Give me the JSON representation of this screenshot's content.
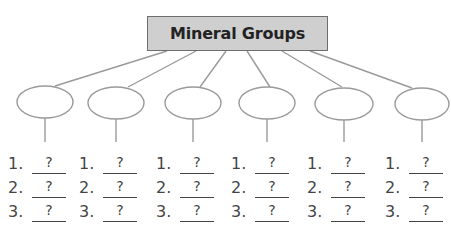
{
  "title": "Mineral Groups",
  "colors": {
    "box_fill": "#cfcfcf",
    "box_border": "#6e6e6e",
    "line": "#9a9a9a",
    "text": "#444444"
  },
  "groups": [
    {
      "cx": 45,
      "items": [
        {
          "num": "1.",
          "answer": "?"
        },
        {
          "num": "2.",
          "answer": "?"
        },
        {
          "num": "3.",
          "answer": "?"
        }
      ]
    },
    {
      "cx": 116,
      "items": [
        {
          "num": "1.",
          "answer": "?"
        },
        {
          "num": "2.",
          "answer": "?"
        },
        {
          "num": "3.",
          "answer": "?"
        }
      ]
    },
    {
      "cx": 193,
      "items": [
        {
          "num": "1.",
          "answer": "?"
        },
        {
          "num": "2.",
          "answer": "?"
        },
        {
          "num": "3.",
          "answer": "?"
        }
      ]
    },
    {
      "cx": 267,
      "items": [
        {
          "num": "1.",
          "answer": "?"
        },
        {
          "num": "2.",
          "answer": "?"
        },
        {
          "num": "3.",
          "answer": "?"
        }
      ]
    },
    {
      "cx": 344,
      "items": [
        {
          "num": "1.",
          "answer": "?"
        },
        {
          "num": "2.",
          "answer": "?"
        },
        {
          "num": "3.",
          "answer": "?"
        }
      ]
    },
    {
      "cx": 422,
      "items": [
        {
          "num": "1.",
          "answer": "?"
        },
        {
          "num": "2.",
          "answer": "?"
        },
        {
          "num": "3.",
          "answer": "?"
        }
      ]
    }
  ]
}
